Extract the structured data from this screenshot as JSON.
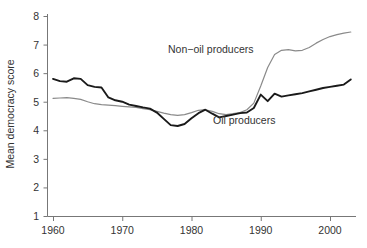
{
  "chart_data": {
    "type": "line",
    "title": "",
    "subtitle": "",
    "xlabel": "",
    "ylabel": "Mean democracy score",
    "xlim": [
      1959,
      2004
    ],
    "ylim": [
      1,
      8
    ],
    "grid": false,
    "legend_position": "inline-annotation",
    "xticks": [
      1960,
      1970,
      1980,
      1990,
      2000
    ],
    "yticks": [
      1,
      2,
      3,
      4,
      5,
      6,
      7,
      8
    ],
    "x": [
      1960,
      1961,
      1962,
      1963,
      1964,
      1965,
      1966,
      1967,
      1968,
      1969,
      1970,
      1971,
      1972,
      1973,
      1974,
      1975,
      1976,
      1977,
      1978,
      1979,
      1980,
      1981,
      1982,
      1983,
      1984,
      1985,
      1986,
      1987,
      1988,
      1989,
      1990,
      1991,
      1992,
      1993,
      1994,
      1995,
      1996,
      1997,
      1998,
      1999,
      2000,
      2001,
      2002,
      2003
    ],
    "series": [
      {
        "name": "Non-oil producers",
        "color": "#8a8a8a",
        "label_text": "Non−oil producers",
        "values": [
          5.12,
          5.13,
          5.14,
          5.12,
          5.08,
          5.0,
          4.93,
          4.9,
          4.88,
          4.86,
          4.84,
          4.82,
          4.8,
          4.76,
          4.72,
          4.66,
          4.6,
          4.55,
          4.52,
          4.55,
          4.62,
          4.7,
          4.72,
          4.66,
          4.58,
          4.55,
          4.58,
          4.62,
          4.72,
          4.95,
          5.55,
          6.2,
          6.65,
          6.8,
          6.82,
          6.78,
          6.8,
          6.9,
          7.05,
          7.18,
          7.28,
          7.35,
          7.4,
          7.44
        ]
      },
      {
        "name": "Oil producers",
        "color": "#1a1a1a",
        "label_text": "Oil producers",
        "values": [
          5.8,
          5.72,
          5.7,
          5.82,
          5.8,
          5.58,
          5.52,
          5.5,
          5.15,
          5.05,
          5.0,
          4.9,
          4.85,
          4.8,
          4.76,
          4.62,
          4.4,
          4.18,
          4.15,
          4.22,
          4.42,
          4.6,
          4.72,
          4.58,
          4.45,
          4.5,
          4.55,
          4.6,
          4.62,
          4.78,
          5.25,
          5.02,
          5.28,
          5.18,
          5.22,
          5.26,
          5.3,
          5.36,
          5.42,
          5.48,
          5.52,
          5.56,
          5.6,
          5.78
        ]
      }
    ]
  },
  "annotations": [
    {
      "id": "non-oil-label",
      "text": "Non−oil producers",
      "x_px": 168,
      "y_px": 53
    },
    {
      "id": "oil-label",
      "text": "Oil producers",
      "x_px": 213,
      "y_px": 124
    }
  ],
  "axis": {
    "y_title": "Mean democracy score",
    "x_tick_labels": [
      "1960",
      "1970",
      "1980",
      "1990",
      "2000"
    ],
    "y_tick_labels": [
      "8",
      "7",
      "6",
      "5",
      "4",
      "3",
      "2",
      "1"
    ]
  },
  "colors": {
    "non_oil_line": "#8a8a8a",
    "oil_line": "#1a1a1a",
    "axis": "#777777",
    "text": "#333333",
    "background": "#ffffff"
  }
}
